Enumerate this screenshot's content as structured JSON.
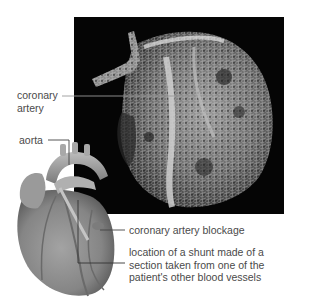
{
  "figure": {
    "photo_panel": {
      "description": "micro-CT / cast image of coronary vessels of a heart on black background",
      "background_color": "#050505"
    },
    "illustration": {
      "description": "drawing of human heart with coronary artery and shunt",
      "tint_color": "#8a8a8a"
    },
    "labels": {
      "coronary_artery": [
        "coronary",
        "artery"
      ],
      "aorta": "aorta",
      "blockage": "coronary artery blockage",
      "shunt": [
        "location of a shunt made of a",
        "section taken from one of the",
        "patient's other blood vessels"
      ]
    },
    "colors": {
      "label_text": "#4a4a4a",
      "leader_line": "#555555"
    }
  }
}
